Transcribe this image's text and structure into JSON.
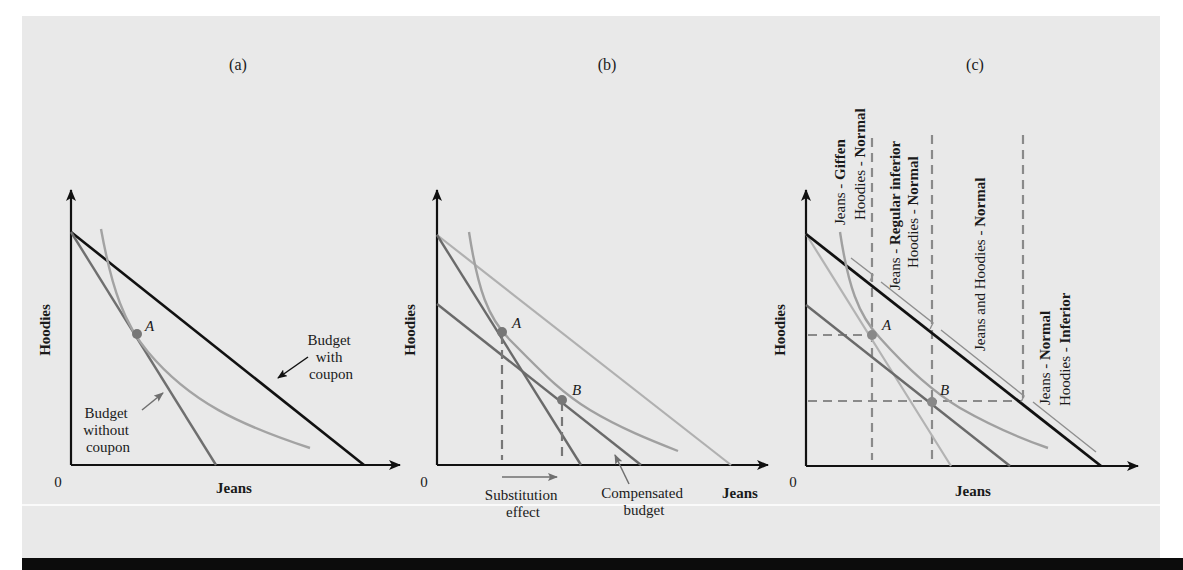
{
  "figure": {
    "panels": [
      {
        "id": "a",
        "label": "(a)",
        "x_axis_label": "Jeans",
        "y_axis_label": "Hoodies",
        "origin_label": "0",
        "point_labels": [
          "A"
        ],
        "annotations": {
          "budget_with_coupon": [
            "Budget",
            "with",
            "coupon"
          ],
          "budget_without_coupon": [
            "Budget",
            "without",
            "coupon"
          ]
        }
      },
      {
        "id": "b",
        "label": "(b)",
        "x_axis_label": "Jeans",
        "y_axis_label": "Hoodies",
        "origin_label": "0",
        "point_labels": [
          "A",
          "B"
        ],
        "annotations": {
          "substitution_effect": [
            "Substitution",
            "effect"
          ],
          "compensated_budget": [
            "Compensated",
            "budget"
          ]
        }
      },
      {
        "id": "c",
        "label": "(c)",
        "x_axis_label": "Jeans",
        "y_axis_label": "Hoodies",
        "origin_label": "0",
        "point_labels": [
          "A",
          "B"
        ],
        "regions": [
          {
            "line1_prefix": "Jeans - ",
            "line1_bold": "Giffen",
            "line2_prefix": "Hoodies - ",
            "line2_bold": "Normal"
          },
          {
            "line1_prefix": "Jeans - ",
            "line1_bold": "Regular inferior",
            "line2_prefix": "Hoodies - ",
            "line2_bold": "Normal"
          },
          {
            "line1_prefix": "Jeans and Hoodies - ",
            "line1_bold": "Normal",
            "line2_prefix": "",
            "line2_bold": ""
          },
          {
            "line1_prefix": "Jeans - ",
            "line1_bold": "Normal",
            "line2_prefix": "Hoodies - ",
            "line2_bold": "Inferior"
          }
        ]
      }
    ],
    "colors": {
      "background": "#e9e9e9",
      "axis": "#111111",
      "budget_dark": "#111111",
      "budget_mid": "#707070",
      "budget_light": "#a9a9a9",
      "indifference": "#9a9a9a",
      "dashed": "#8a8a8a",
      "point": "#777777"
    }
  }
}
